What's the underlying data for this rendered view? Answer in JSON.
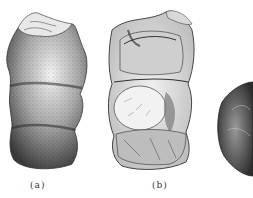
{
  "figure": {
    "panels": [
      {
        "id": "a",
        "label": "(a)",
        "description": "exterior view of segmented fossil specimen with stippled surface"
      },
      {
        "id": "b",
        "label": "(b)",
        "description": "cut-away view showing internal chambers of specimen"
      },
      {
        "id": "c",
        "label": "",
        "description": "partially visible rough specimen at right edge"
      }
    ]
  }
}
